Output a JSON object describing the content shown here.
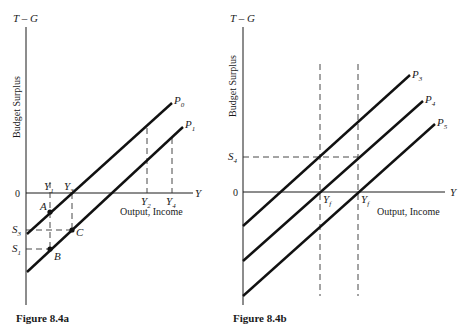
{
  "figure_a": {
    "caption": "Figure 8.4a",
    "y_axis_label": "T – G",
    "y_axis_title": "Budget Surplus",
    "x_axis_label": "Y",
    "x_axis_title": "Output, Income",
    "origin_label": "0",
    "lines": [
      {
        "name": "P",
        "sub": "0"
      },
      {
        "name": "P",
        "sub": "1"
      }
    ],
    "x_ticks": [
      {
        "name": "Y",
        "sub": "1"
      },
      {
        "name": "Y",
        "sub": "3"
      },
      {
        "name": "Y",
        "sub": "2"
      },
      {
        "name": "Y",
        "sub": "4"
      }
    ],
    "y_ticks": [
      {
        "name": "S",
        "sub": "3"
      },
      {
        "name": "S",
        "sub": "1"
      }
    ],
    "points": [
      "A",
      "B",
      "C"
    ]
  },
  "figure_b": {
    "caption": "Figure 8.4b",
    "y_axis_label": "T – G",
    "y_axis_title": "Budget Surplus",
    "x_axis_label": "Y",
    "x_axis_title": "Output, Income",
    "origin_label": "0",
    "lines": [
      {
        "name": "P",
        "sub": "3"
      },
      {
        "name": "P",
        "sub": "4"
      },
      {
        "name": "P",
        "sub": "5"
      }
    ],
    "x_ticks": [
      {
        "name": "Y",
        "sub": "f"
      },
      {
        "name": "Y",
        "sub": "f"
      }
    ],
    "y_ticks": [
      {
        "name": "S",
        "sub": "4"
      }
    ]
  }
}
